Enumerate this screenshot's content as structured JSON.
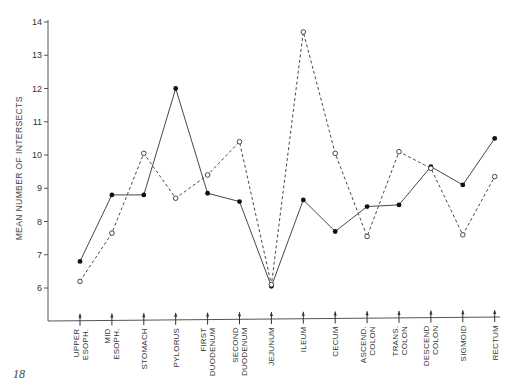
{
  "page": {
    "number": "18"
  },
  "chart_data": {
    "type": "line",
    "title": "",
    "xlabel": "",
    "ylabel": "MEAN NUMBER OF INTERSECTS",
    "ylim": [
      5,
      14
    ],
    "yticks": [
      6,
      7,
      8,
      9,
      10,
      11,
      12,
      13,
      14
    ],
    "grid": false,
    "legend": "none",
    "categories": [
      [
        "UPPER",
        "ESOPH."
      ],
      [
        "MID",
        "ESOPH."
      ],
      [
        "STOMACH"
      ],
      [
        "PYLORUS"
      ],
      [
        "FIRST",
        "DUODENUM"
      ],
      [
        "SECOND",
        "DUODENUM"
      ],
      [
        "JEJUNUM"
      ],
      [
        "ILEUM"
      ],
      [
        "CECUM"
      ],
      [
        "ASCEND.",
        "COLON"
      ],
      [
        "TRANS.",
        "COLON"
      ],
      [
        "DESCEND",
        "COLON"
      ],
      [
        "SIGMOID"
      ],
      [
        "RECTUM"
      ]
    ],
    "series": [
      {
        "name": "filled-circle-solid-line",
        "marker": "filled",
        "line": "solid",
        "values": [
          6.8,
          8.8,
          8.8,
          12.0,
          8.85,
          8.6,
          6.05,
          8.65,
          7.7,
          8.45,
          8.5,
          9.65,
          9.1,
          10.5
        ]
      },
      {
        "name": "open-circle-dashed-line",
        "marker": "open",
        "line": "dashed",
        "values": [
          6.2,
          7.65,
          10.05,
          8.7,
          9.4,
          10.4,
          6.1,
          13.7,
          10.05,
          7.55,
          10.1,
          9.6,
          7.6,
          9.35
        ]
      }
    ]
  },
  "colors": {
    "line": "#333333",
    "axis": "#555555",
    "background": "#ffffff"
  }
}
